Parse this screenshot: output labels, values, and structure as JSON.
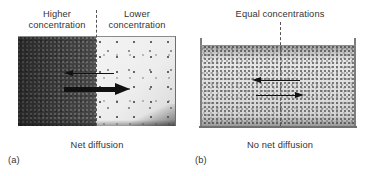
{
  "figure": {
    "panels": [
      {
        "letter": "(a)",
        "caption": "Net diffusion",
        "labels": {
          "left": "Higher\nconcentration",
          "right": "Lower\nconcentration"
        },
        "arrows": [
          {
            "name": "leftward-flux-arrow",
            "direction": "left",
            "weight": "thin"
          },
          {
            "name": "rightward-flux-arrow",
            "direction": "right",
            "weight": "thick"
          }
        ],
        "divider": "dashed-vertical-line"
      },
      {
        "letter": "(b)",
        "caption": "No net diffusion",
        "labels": {
          "top": "Equal concentrations"
        },
        "arrows": [
          {
            "name": "leftward-flux-arrow",
            "direction": "left",
            "weight": "thin"
          },
          {
            "name": "rightward-flux-arrow",
            "direction": "right",
            "weight": "thin"
          }
        ],
        "divider": "dashed-vertical-line"
      }
    ],
    "colors": {
      "background": "#ffffff",
      "text": "#333333",
      "arrow": "#111111",
      "dense_region": "#3a3a3a",
      "sparse_region": "#f0f0f0",
      "uniform_region": "#e2e2e2",
      "divider": "#555555",
      "wall": "#7d7d7d"
    }
  }
}
